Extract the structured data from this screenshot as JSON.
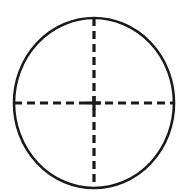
{
  "figure": {
    "name": "crosshair-reticle",
    "background_color": "#ffffff",
    "stroke_color": "#1a1a1a",
    "canvas": {
      "width": 188,
      "height": 195
    }
  },
  "circle": {
    "name": "outer-circle",
    "center_x": 94,
    "center_y": 103,
    "radius_x": 80,
    "radius_y": 85,
    "stroke_width": 2.6,
    "fill": "none",
    "stroke_color": "#1a1a1a"
  },
  "crosshair": {
    "vertical": {
      "name": "vertical-dashed-line",
      "x": 94,
      "y1": 18,
      "y2": 188,
      "stroke_width": 3.2,
      "dash": "8 5",
      "stroke_color": "#1a1a1a"
    },
    "horizontal": {
      "name": "horizontal-dashed-line",
      "y": 103,
      "x1": 14,
      "x2": 174,
      "stroke_width": 3.2,
      "dash": "8 5",
      "stroke_color": "#1a1a1a"
    },
    "center_tick": {
      "name": "center-intersection-tick",
      "x": 94,
      "y": 103,
      "half_length": 7,
      "stroke_width": 3.2
    }
  },
  "labels": {
    "caption": ""
  }
}
